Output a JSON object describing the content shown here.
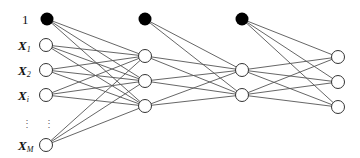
{
  "diagram": {
    "type": "feedforward-neural-network",
    "layers": [
      {
        "name": "input",
        "bias": {
          "label": "1",
          "x": 47,
          "y": 19
        },
        "x": 46,
        "nodes_y": [
          45,
          70,
          95,
          145
        ]
      },
      {
        "name": "hidden-1",
        "bias": {
          "x": 145,
          "y": 19
        },
        "x": 145,
        "nodes_y": [
          56,
          81,
          106
        ]
      },
      {
        "name": "hidden-2",
        "bias": {
          "x": 242,
          "y": 19
        },
        "x": 242,
        "nodes_y": [
          70,
          95
        ]
      },
      {
        "name": "output",
        "x": 338,
        "nodes_y": [
          57,
          82,
          107
        ]
      }
    ],
    "input_labels": [
      {
        "main": "X",
        "sub": "1"
      },
      {
        "main": "X",
        "sub": "2"
      },
      {
        "main": "X",
        "sub": "i"
      },
      {
        "main": "X",
        "sub": "M"
      }
    ],
    "bias_label": "1",
    "ellipsis": "⋮",
    "colors": {
      "edge": "#555555",
      "node_stroke": "#333333",
      "bias_fill": "#000000",
      "node_fill": "#ffffff"
    }
  }
}
